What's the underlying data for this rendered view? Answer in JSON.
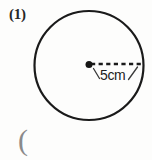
{
  "figure": {
    "problem_number": "(1)",
    "radius_label": "5cm",
    "stray_mark": "(",
    "shape": "circle",
    "center_dot": "center-point-dot",
    "radius_line_style": "dashed",
    "colors": {
      "background": "#fdfdfc",
      "stroke": "#1a1a1a",
      "text": "#262626",
      "stray_mark": "#8a8a8a"
    },
    "geometry": {
      "circle_center_x": 89,
      "circle_center_y": 65.5,
      "circle_radius": 54.5,
      "stroke_width": 2.2,
      "dot_radius": 3.4,
      "radius_line_from_x": 89,
      "radius_line_to_x": 144,
      "radius_line_y": 64
    }
  }
}
